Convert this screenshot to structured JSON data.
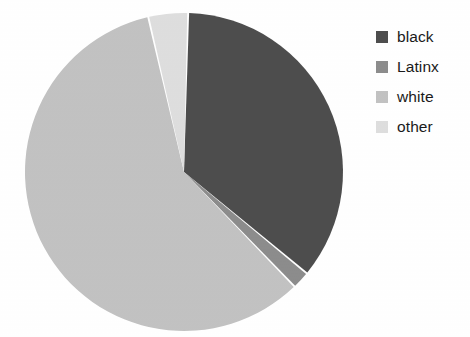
{
  "chart_data": {
    "type": "pie",
    "title": "",
    "subtitle": "",
    "xlabel": "",
    "ylabel": "",
    "grid": false,
    "legend_position": "right",
    "start_angle_deg": 0,
    "direction": "clockwise",
    "categories": [
      "black",
      "Latinx",
      "white",
      "other"
    ],
    "values": [
      35.5,
      1.8,
      58.7,
      4.0
    ],
    "units": "percent",
    "labels_shown": false,
    "slices": [
      {
        "name": "black",
        "label": "black",
        "value": 35.5,
        "color": "#4d4d4d",
        "start_deg": 1.5,
        "end_deg": 129.5
      },
      {
        "name": "Latinx",
        "label": "Latinx",
        "value": 1.8,
        "color": "#8c8c8c",
        "start_deg": 129.5,
        "end_deg": 136.0
      },
      {
        "name": "white",
        "label": "white",
        "value": 58.7,
        "color": "#c2c2c2",
        "start_deg": 136.0,
        "end_deg": 347.0
      },
      {
        "name": "other",
        "label": "other",
        "value": 4.0,
        "color": "#dedede",
        "start_deg": 347.0,
        "end_deg": 361.5
      }
    ],
    "geometry": {
      "center_x": 184,
      "center_y": 172,
      "radius": 159
    }
  },
  "legend": {
    "items": [
      {
        "label": "black",
        "color": "#4d4d4d",
        "swatch_name": "legend-swatch-black"
      },
      {
        "label": "Latinx",
        "color": "#8c8c8c",
        "swatch_name": "legend-swatch-latinx"
      },
      {
        "label": "white",
        "color": "#c2c2c2",
        "swatch_name": "legend-swatch-white"
      },
      {
        "label": "other",
        "color": "#dedede",
        "swatch_name": "legend-swatch-other"
      }
    ]
  }
}
